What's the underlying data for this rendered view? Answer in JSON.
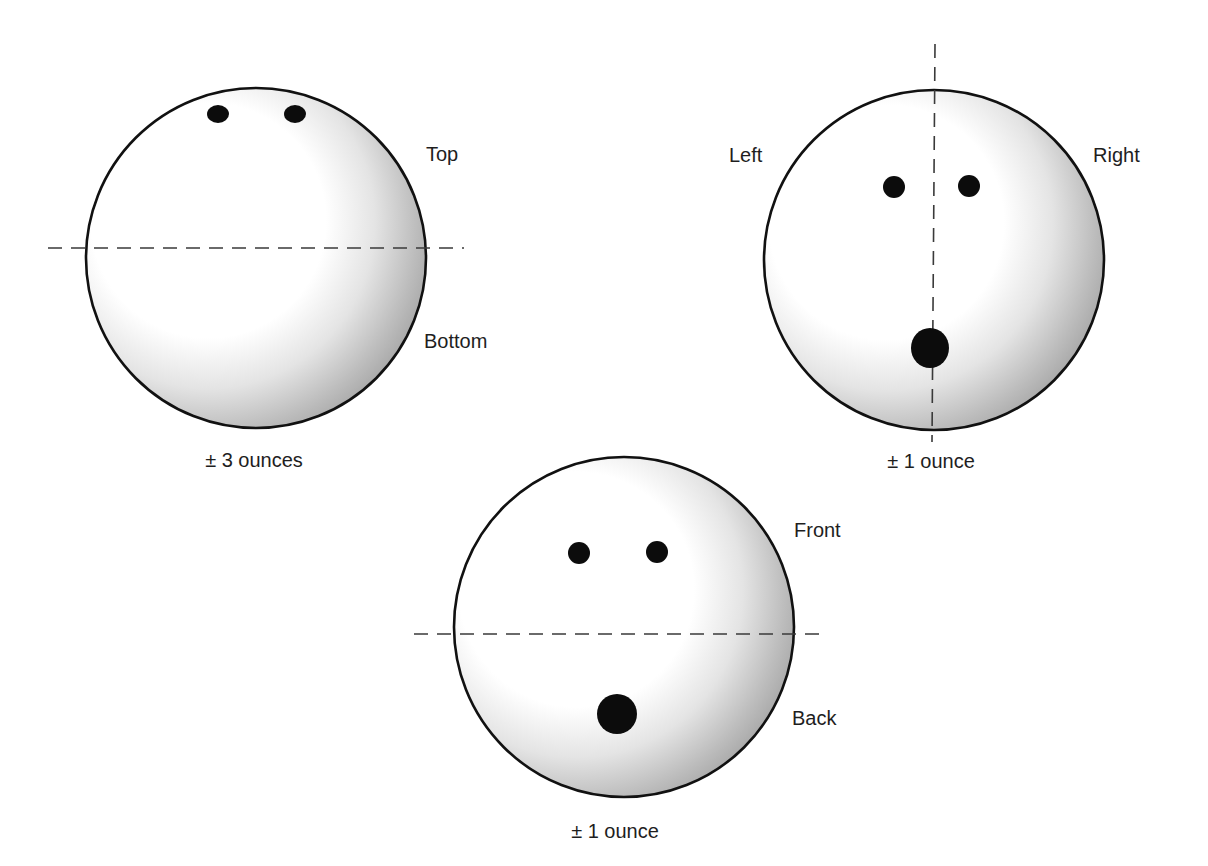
{
  "figure": {
    "colors": {
      "background": "#ffffff",
      "ball_highlight": "#ffffff",
      "ball_shadow": "#9c9c9c",
      "outline": "#111111",
      "hole": "#0c0c0c",
      "axis": "#3a3a3a",
      "text": "#1e1e1e"
    },
    "balls": [
      {
        "id": "top-bottom",
        "cx": 256,
        "cy": 258,
        "r": 170,
        "axis": {
          "orientation": "horizontal",
          "x1": 48,
          "y1": 248,
          "x2": 464,
          "y2": 248
        },
        "finger_holes": [
          {
            "cx": 218,
            "cy": 114,
            "rx": 11,
            "ry": 9
          },
          {
            "cx": 295,
            "cy": 114,
            "rx": 11,
            "ry": 9
          }
        ],
        "thumb_hole": null,
        "labels": [
          {
            "text": "Top",
            "x": 426,
            "y": 161
          },
          {
            "text": "Bottom",
            "x": 424,
            "y": 348
          }
        ],
        "caption": {
          "text": "± 3 ounces",
          "x": 254,
          "y": 467
        }
      },
      {
        "id": "left-right",
        "cx": 934,
        "cy": 260,
        "r": 170,
        "axis": {
          "orientation": "vertical",
          "x1": 935,
          "y1": 44,
          "x2": 932,
          "y2": 442
        },
        "finger_holes": [
          {
            "cx": 894,
            "cy": 187,
            "rx": 11,
            "ry": 11
          },
          {
            "cx": 969,
            "cy": 186,
            "rx": 11,
            "ry": 11
          }
        ],
        "thumb_hole": {
          "cx": 930,
          "cy": 348,
          "rx": 19,
          "ry": 20
        },
        "labels": [
          {
            "text": "Left",
            "x": 729,
            "y": 162
          },
          {
            "text": "Right",
            "x": 1093,
            "y": 162
          }
        ],
        "caption": {
          "text": "± 1 ounce",
          "x": 931,
          "y": 468
        }
      },
      {
        "id": "front-back",
        "cx": 624,
        "cy": 627,
        "r": 170,
        "axis": {
          "orientation": "horizontal",
          "x1": 414,
          "y1": 634,
          "x2": 828,
          "y2": 634
        },
        "finger_holes": [
          {
            "cx": 579,
            "cy": 553,
            "rx": 11,
            "ry": 11
          },
          {
            "cx": 657,
            "cy": 552,
            "rx": 11,
            "ry": 11
          }
        ],
        "thumb_hole": {
          "cx": 617,
          "cy": 714,
          "rx": 20,
          "ry": 20
        },
        "labels": [
          {
            "text": "Front",
            "x": 794,
            "y": 537
          },
          {
            "text": "Back",
            "x": 792,
            "y": 725
          }
        ],
        "caption": {
          "text": "± 1 ounce",
          "x": 615,
          "y": 838
        }
      }
    ]
  }
}
